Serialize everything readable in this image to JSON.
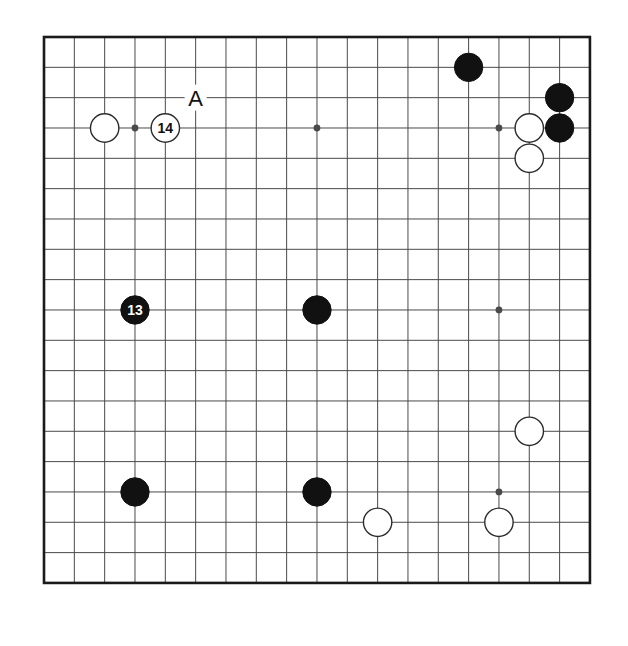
{
  "diagram": {
    "type": "go-board-diagram",
    "title": "",
    "board_size": 19,
    "geometry": {
      "origin_x": 44,
      "origin_y": 37,
      "cell": 30.33,
      "stone_radius": 14.2,
      "border_width": 2.6,
      "line_width": 1.0,
      "hoshi_radius": 3.4
    },
    "colors": {
      "background": "#ffffff",
      "grid_line": "#4a4a4a",
      "border_line": "#1a1a1a",
      "black_stone": "#111111",
      "white_stone_fill": "#ffffff",
      "white_stone_edge": "#2b2b2b",
      "label_on_black": "#ffffff",
      "label_on_white": "#111111",
      "coord_text": "#111111"
    },
    "hoshi": [
      {
        "col": 3,
        "row": 3
      },
      {
        "col": 9,
        "row": 3
      },
      {
        "col": 15,
        "row": 3
      },
      {
        "col": 3,
        "row": 9
      },
      {
        "col": 9,
        "row": 9
      },
      {
        "col": 15,
        "row": 9
      },
      {
        "col": 3,
        "row": 15
      },
      {
        "col": 9,
        "row": 15
      },
      {
        "col": 15,
        "row": 15
      }
    ],
    "stones": [
      {
        "id": "b-q18",
        "color": "black",
        "col": 14,
        "row": 1,
        "label": ""
      },
      {
        "id": "b-s17",
        "color": "black",
        "col": 17,
        "row": 2,
        "label": ""
      },
      {
        "id": "b-s16",
        "color": "black",
        "col": 17,
        "row": 3,
        "label": ""
      },
      {
        "id": "w-r16",
        "color": "white",
        "col": 16,
        "row": 3,
        "label": ""
      },
      {
        "id": "w-r15",
        "color": "white",
        "col": 16,
        "row": 4,
        "label": ""
      },
      {
        "id": "w-c16",
        "color": "white",
        "col": 2,
        "row": 3,
        "label": ""
      },
      {
        "id": "w-move-14",
        "color": "white",
        "col": 4,
        "row": 3,
        "label": "14"
      },
      {
        "id": "b-move-13",
        "color": "black",
        "col": 3,
        "row": 9,
        "label": "13"
      },
      {
        "id": "b-k10",
        "color": "black",
        "col": 9,
        "row": 9,
        "label": ""
      },
      {
        "id": "b-d4",
        "color": "black",
        "col": 3,
        "row": 15,
        "label": ""
      },
      {
        "id": "b-k4",
        "color": "black",
        "col": 9,
        "row": 15,
        "label": ""
      },
      {
        "id": "w-r7",
        "color": "white",
        "col": 16,
        "row": 13,
        "label": ""
      },
      {
        "id": "w-m3",
        "color": "white",
        "col": 11,
        "row": 16,
        "label": ""
      },
      {
        "id": "w-q3",
        "color": "white",
        "col": 15,
        "row": 16,
        "label": ""
      }
    ],
    "annotations": [
      {
        "id": "point-a",
        "text": "A",
        "col": 5,
        "row": 2,
        "font_size": 22
      }
    ],
    "move_numbers": [
      "13",
      "14"
    ],
    "coordinate_letters": [
      "A"
    ]
  }
}
